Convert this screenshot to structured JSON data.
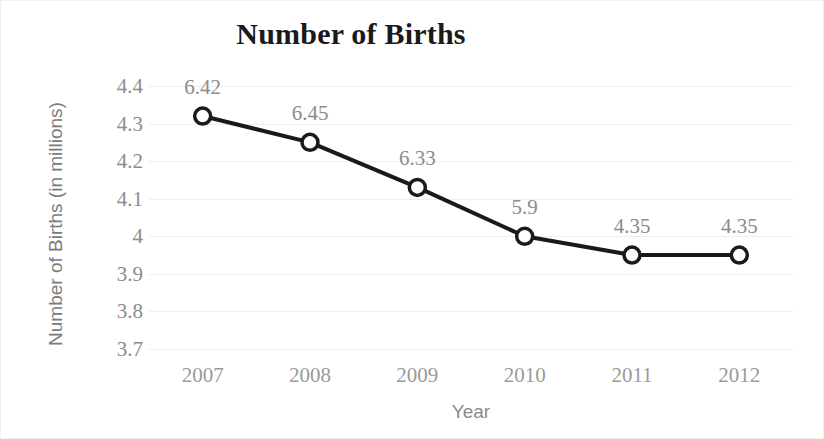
{
  "chart_data": {
    "type": "line",
    "title": "Number of Births",
    "xlabel": "Year",
    "ylabel": "Number of Births (in millions)",
    "categories": [
      "2007",
      "2008",
      "2009",
      "2010",
      "2011",
      "2012"
    ],
    "values": [
      4.32,
      4.25,
      4.13,
      4.0,
      3.95,
      3.95
    ],
    "point_labels": [
      "6.42",
      "6.45",
      "6.33",
      "5.9",
      "4.35",
      "4.35"
    ],
    "ylim": [
      3.7,
      4.4
    ],
    "yticks": [
      "4.4",
      "4.3",
      "4.2",
      "4.1",
      "4",
      "3.9",
      "3.8",
      "3.7"
    ],
    "ytick_values": [
      4.4,
      4.3,
      4.2,
      4.1,
      4.0,
      3.9,
      3.8,
      3.7
    ],
    "grid": true,
    "legend": false,
    "series_color": "#1a1a1a",
    "marker_fill": "#ffffff",
    "grid_color": "#efefef",
    "label_color": "#8c8c8c",
    "axis_title_color": "#7b7b7b"
  }
}
